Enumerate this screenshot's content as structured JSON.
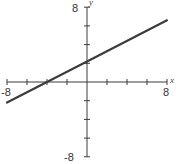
{
  "chart_data": {
    "type": "line",
    "title": "",
    "xlabel": "x",
    "ylabel": "y",
    "xlim": [
      -8,
      8
    ],
    "ylim": [
      -8,
      8
    ],
    "x_tick_step": 2,
    "y_tick_step": 2,
    "tick_labels": {
      "x_min": "-8",
      "x_max": "8",
      "y_min": "-8",
      "y_max": "8"
    },
    "grid": false,
    "legend": null,
    "series": [
      {
        "name": "line",
        "x": [
          -8,
          -4,
          0,
          8
        ],
        "y": [
          -2.2,
          0,
          2.2,
          6.6
        ]
      }
    ]
  }
}
